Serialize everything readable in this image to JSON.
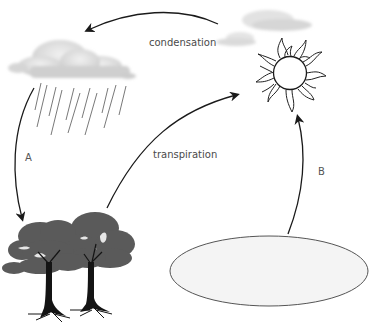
{
  "diagram": {
    "labels": {
      "condensation": "condensation",
      "transpiration": "transpiration",
      "a": "A",
      "b": "B"
    },
    "elements": {
      "rain_cloud": "rain-cloud",
      "small_clouds": "clouds-near-sun",
      "sun": "sun",
      "trees": "trees",
      "water_body": "water-body"
    },
    "arrows": [
      {
        "from": "clouds-near-sun",
        "to": "rain-cloud",
        "label": "condensation"
      },
      {
        "from": "rain-cloud",
        "to": "trees",
        "label": "A"
      },
      {
        "from": "trees",
        "to": "sun",
        "label": "transpiration"
      },
      {
        "from": "water-body",
        "to": "sun",
        "label": "B"
      }
    ],
    "colors": {
      "stroke": "#1a1a1a",
      "cloud": "#d9d9d9",
      "tree_canopy": "#5a5a5a",
      "tree_trunk": "#141414",
      "water_fill": "#f4f4f4",
      "water_stroke": "#555555",
      "text": "#4a4a4a"
    }
  }
}
